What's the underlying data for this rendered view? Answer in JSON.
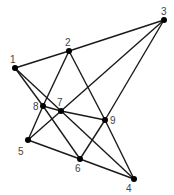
{
  "diagram": {
    "type": "graph",
    "nodes": [
      {
        "id": "1",
        "label": "1",
        "x": 15,
        "y": 68,
        "lx": 10,
        "ly": 63
      },
      {
        "id": "2",
        "label": "2",
        "x": 69,
        "y": 51,
        "lx": 65,
        "ly": 46
      },
      {
        "id": "3",
        "label": "3",
        "x": 164,
        "y": 20,
        "lx": 161,
        "ly": 15
      },
      {
        "id": "4",
        "label": "4",
        "x": 134,
        "y": 179,
        "lx": 126,
        "ly": 192
      },
      {
        "id": "5",
        "label": "5",
        "x": 28,
        "y": 140,
        "lx": 18,
        "ly": 155
      },
      {
        "id": "6",
        "label": "6",
        "x": 80,
        "y": 159,
        "lx": 75,
        "ly": 172
      },
      {
        "id": "7",
        "label": "7",
        "x": 61,
        "y": 111,
        "lx": 57,
        "ly": 106
      },
      {
        "id": "8",
        "label": "8",
        "x": 43,
        "y": 106,
        "lx": 33,
        "ly": 110
      },
      {
        "id": "9",
        "label": "9",
        "x": 105,
        "y": 120,
        "lx": 110,
        "ly": 124
      }
    ],
    "edges": [
      {
        "from": "1",
        "to": "2"
      },
      {
        "from": "2",
        "to": "3"
      },
      {
        "from": "1",
        "to": "8"
      },
      {
        "from": "8",
        "to": "6"
      },
      {
        "from": "1",
        "to": "4"
      },
      {
        "from": "2",
        "to": "8"
      },
      {
        "from": "8",
        "to": "5"
      },
      {
        "from": "2",
        "to": "9"
      },
      {
        "from": "9",
        "to": "4"
      },
      {
        "from": "8",
        "to": "7"
      },
      {
        "from": "7",
        "to": "9"
      },
      {
        "from": "5",
        "to": "7"
      },
      {
        "from": "7",
        "to": "3"
      },
      {
        "from": "6",
        "to": "9"
      },
      {
        "from": "9",
        "to": "3"
      },
      {
        "from": "5",
        "to": "6"
      },
      {
        "from": "6",
        "to": "4"
      }
    ]
  }
}
